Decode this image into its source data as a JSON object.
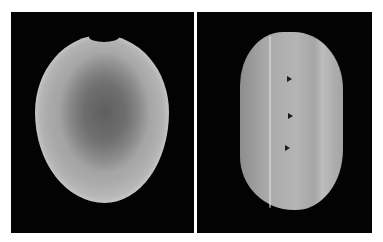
{
  "figure": {
    "panels": [
      {
        "id": "left",
        "subject": "seed-front-view",
        "background": "#030303"
      },
      {
        "id": "right",
        "subject": "seed-side-view",
        "background": "#030303",
        "arrowhead_count": 3
      }
    ],
    "colors": {
      "page_background": "#ffffff",
      "panel_background": "#030303",
      "seed_tone": "#a9a9a9",
      "arrowhead": "#1a1a1a"
    }
  }
}
